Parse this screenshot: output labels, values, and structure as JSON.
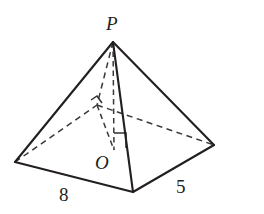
{
  "figure": {
    "kind": "rectangular-pyramid-diagram",
    "background_color": "#ffffff",
    "stroke_color": "#231f20",
    "hidden_stroke_color": "#3b3739",
    "width": 264,
    "height": 214,
    "labels": {
      "apex": "P",
      "base_center": "O",
      "base_length": "8",
      "base_width": "5"
    },
    "vertices": {
      "apex_P": {
        "x": 113,
        "y": 42
      },
      "base_left": {
        "x": 15,
        "y": 162
      },
      "base_front": {
        "x": 133,
        "y": 192
      },
      "base_right": {
        "x": 214,
        "y": 145
      },
      "base_back": {
        "x": 97,
        "y": 105
      },
      "center_O": {
        "x": 114,
        "y": 150
      }
    },
    "visible_edges": [
      "P-left",
      "P-front",
      "P-right",
      "left-front",
      "front-right"
    ],
    "hidden_edges": [
      "P-back",
      "left-back",
      "back-right",
      "P-O altitude",
      "back-O diagonal"
    ],
    "angle_markers": [
      "right-angle-at-O",
      "angle-at-back-vertex"
    ]
  }
}
